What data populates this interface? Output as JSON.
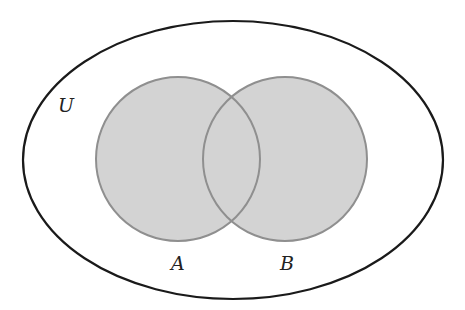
{
  "diagram": {
    "type": "venn",
    "universe": {
      "label": "U",
      "stroke": "#1a1a1a",
      "fill": "#ffffff"
    },
    "sets": [
      {
        "label": "A",
        "fill": "#d3d3d3",
        "stroke": "#8f8f8f"
      },
      {
        "label": "B",
        "fill": "#d3d3d3",
        "stroke": "#8f8f8f"
      }
    ],
    "shaded_region": "A ∪ B"
  }
}
